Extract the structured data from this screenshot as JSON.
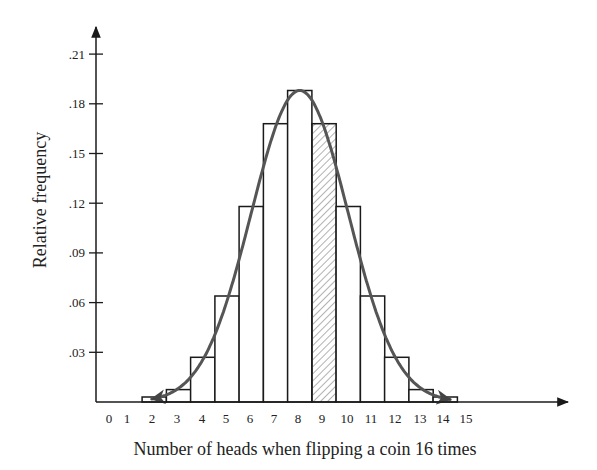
{
  "chart_data": {
    "type": "bar",
    "subtype": "histogram-with-normal-curve",
    "title": "",
    "xlabel": "Number of heads when flipping a coin 16 times",
    "ylabel": "Relative frequency",
    "x_tick_labels": [
      "0",
      "1",
      "2",
      "3",
      "4",
      "5",
      "6",
      "7",
      "8",
      "9",
      "10",
      "11",
      "12",
      "13",
      "14",
      "15"
    ],
    "y_tick_labels": [
      ".03",
      ".06",
      ".09",
      ".12",
      ".15",
      ".18",
      ".21"
    ],
    "y_ticks": [
      0.03,
      0.06,
      0.09,
      0.12,
      0.15,
      0.18,
      0.21
    ],
    "ylim": [
      0,
      0.22
    ],
    "categories": [
      2,
      3,
      4,
      5,
      6,
      7,
      8,
      9,
      10,
      11,
      12,
      13,
      14
    ],
    "values": [
      0.003,
      0.0075,
      0.027,
      0.064,
      0.118,
      0.168,
      0.188,
      0.168,
      0.118,
      0.064,
      0.027,
      0.0075,
      0.003
    ],
    "highlighted_bar": 9,
    "highlight_style": "diagonal-hatch",
    "overlay_curve": {
      "type": "normal",
      "mean": 8,
      "sd": 2,
      "color": "#555555",
      "arrows_both_ends": true
    },
    "grid": false,
    "legend": null,
    "colors": {
      "bar_outline": "#1a1a1a",
      "curve": "#555555",
      "axis": "#1a1a1a",
      "background": "#ffffff"
    }
  }
}
